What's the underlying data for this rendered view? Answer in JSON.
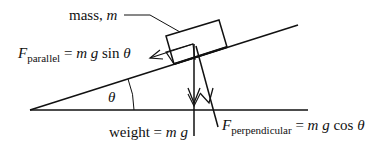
{
  "diagram": {
    "type": "inclined-plane-free-body",
    "labels": {
      "mass_prefix": "mass, ",
      "mass_var": "m",
      "f_parallel_F": "F",
      "f_parallel_sub": "parallel",
      "f_parallel_eq": " = ",
      "f_parallel_expr_m": "m",
      "f_parallel_expr_g": " g",
      "f_parallel_expr_fn": " sin ",
      "f_parallel_expr_theta": "θ",
      "angle": "θ",
      "weight_prefix": "weight",
      "weight_eq": " = ",
      "weight_m": "m",
      "weight_g": " g",
      "f_perp_F": "F",
      "f_perp_sub": "perpendicular",
      "f_perp_eq": " = ",
      "f_perp_m": "m",
      "f_perp_g": " g",
      "f_perp_fn": " cos ",
      "f_perp_theta": "θ"
    },
    "colors": {
      "stroke": "#111111",
      "background": "#ffffff"
    }
  }
}
